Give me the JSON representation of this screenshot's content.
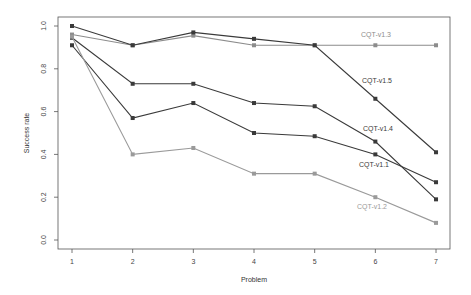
{
  "chart_data": {
    "type": "line",
    "title": "",
    "xlabel": "Problem",
    "ylabel": "Success rate",
    "x": [
      1,
      2,
      3,
      4,
      5,
      6,
      7
    ],
    "x_tick_labels": [
      "1",
      "2",
      "3",
      "4",
      "5",
      "6",
      "7"
    ],
    "y_ticks": [
      0.0,
      0.2,
      0.4,
      0.6,
      0.8,
      1.0
    ],
    "y_tick_labels": [
      "0.0",
      "0.2",
      "0.4",
      "0.6",
      "0.8",
      "1.0"
    ],
    "ylim": [
      0.0,
      1.0
    ],
    "grid": false,
    "legend": "inline labels near line ends",
    "series": [
      {
        "name": "CQT-v1.3",
        "color": "#8c8c8c",
        "values": [
          0.96,
          0.91,
          0.955,
          0.91,
          0.91,
          0.91,
          0.91
        ],
        "label_pos": [
          376,
          37
        ]
      },
      {
        "name": "CQT-v1.5",
        "color": "#3a3a3a",
        "values": [
          1.0,
          0.91,
          0.97,
          0.94,
          0.91,
          0.66,
          0.41
        ],
        "label_pos": [
          377,
          83
        ]
      },
      {
        "name": "CQT-v1.4",
        "color": "#3a3a3a",
        "values": [
          0.945,
          0.73,
          0.73,
          0.64,
          0.625,
          0.46,
          0.19
        ],
        "label_pos": [
          378,
          131
        ]
      },
      {
        "name": "CQT-v1.1",
        "color": "#3a3a3a",
        "values": [
          0.91,
          0.57,
          0.64,
          0.5,
          0.485,
          0.4,
          0.27
        ],
        "label_pos": [
          374,
          167
        ]
      },
      {
        "name": "CQT-v1.2",
        "color": "#9a9a9a",
        "values": [
          0.95,
          0.4,
          0.43,
          0.31,
          0.31,
          0.2,
          0.08
        ],
        "label_pos": [
          372,
          209
        ]
      }
    ]
  }
}
